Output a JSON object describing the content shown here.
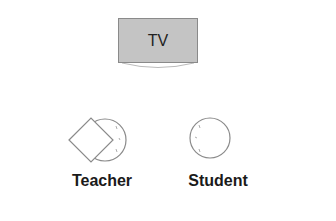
{
  "tv": {
    "label": "TV"
  },
  "people": [
    {
      "role": "teacher",
      "label": "Teacher"
    },
    {
      "role": "student",
      "label": "Student"
    }
  ],
  "colors": {
    "tv_fill": "#c4c4c4",
    "outline": "#8a8a8a",
    "text": "#1a1a1a"
  }
}
